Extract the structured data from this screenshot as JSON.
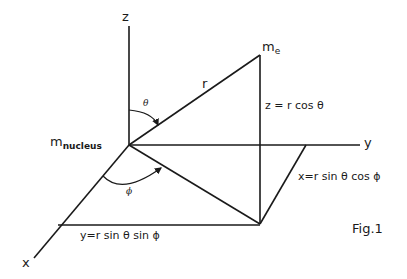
{
  "figure": {
    "caption": "Fig.1",
    "axes": {
      "z": "z",
      "y": "y",
      "x": "x"
    },
    "points": {
      "nucleus": {
        "m": "m",
        "sub": "nucleus"
      },
      "electron": {
        "m": "m",
        "sub": "e"
      }
    },
    "radius_label": "r",
    "angles": {
      "theta": "θ",
      "phi": "ϕ"
    },
    "equations": {
      "z": "z = r cos θ",
      "x": "x=r sin θ cos ϕ",
      "y": "y=r sin θ sin ϕ"
    }
  }
}
